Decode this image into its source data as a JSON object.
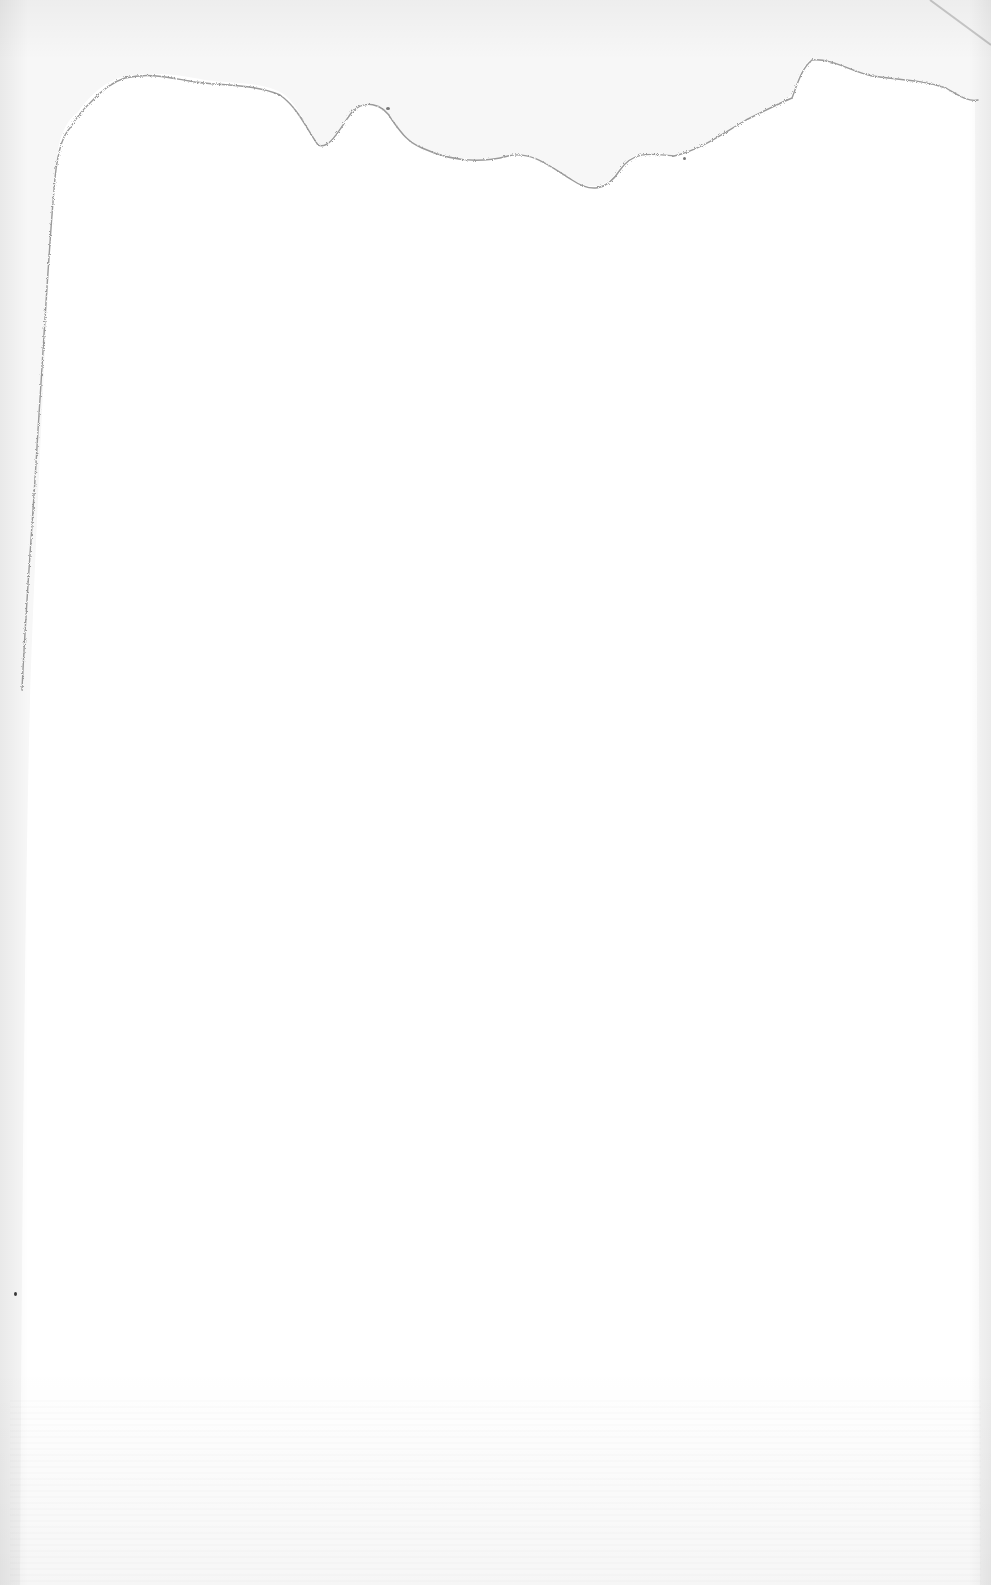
{
  "document": {
    "type": "scanned blank page",
    "text_content": "",
    "colors": {
      "page": "#ffffff",
      "background_margin": "#f7f7f7",
      "tear_edge": "#9a9a9a"
    }
  }
}
